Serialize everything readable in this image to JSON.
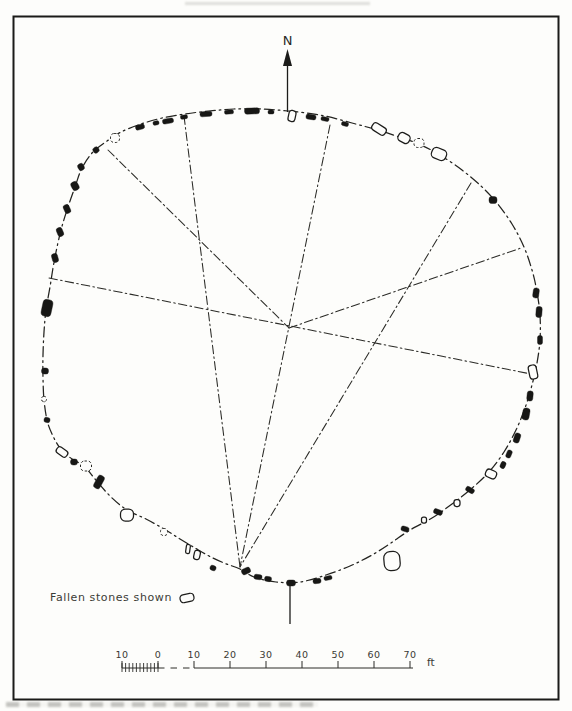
{
  "figure": {
    "background": "#fdfdfb",
    "ink": "#1c1c1a",
    "north": {
      "label": "N"
    },
    "legend": {
      "text": "Fallen stones shown"
    },
    "scalebar": {
      "labels": [
        "10",
        "0",
        "10",
        "20",
        "30",
        "40",
        "50",
        "60",
        "70"
      ],
      "unit": "ft",
      "x0": 122,
      "spacing": 36,
      "y": 668,
      "label_y": 658,
      "minor_step": 3.6,
      "end_x": 413,
      "unit_x": 427,
      "unit_y": 666
    },
    "ring_points": [
      [
        288,
        111
      ],
      [
        320,
        115
      ],
      [
        352,
        123
      ],
      [
        381,
        131
      ],
      [
        405,
        139
      ],
      [
        421,
        145
      ],
      [
        440,
        155
      ],
      [
        462,
        170
      ],
      [
        481,
        186
      ],
      [
        497,
        203
      ],
      [
        512,
        224
      ],
      [
        524,
        247
      ],
      [
        532,
        270
      ],
      [
        537,
        292
      ],
      [
        540,
        315
      ],
      [
        540,
        340
      ],
      [
        537,
        363
      ],
      [
        532,
        385
      ],
      [
        525,
        408
      ],
      [
        516,
        430
      ],
      [
        504,
        452
      ],
      [
        489,
        472
      ],
      [
        471,
        489
      ],
      [
        452,
        504
      ],
      [
        432,
        518
      ],
      [
        410,
        530
      ],
      [
        391,
        543
      ],
      [
        372,
        555
      ],
      [
        350,
        566
      ],
      [
        326,
        575
      ],
      [
        300,
        582
      ],
      [
        276,
        582
      ],
      [
        254,
        577
      ],
      [
        240,
        569
      ],
      [
        224,
        563
      ],
      [
        209,
        556
      ],
      [
        195,
        548
      ],
      [
        180,
        539
      ],
      [
        164,
        529
      ],
      [
        146,
        519
      ],
      [
        127,
        510
      ],
      [
        110,
        496
      ],
      [
        95,
        479
      ],
      [
        84,
        466
      ],
      [
        72,
        459
      ],
      [
        60,
        448
      ],
      [
        52,
        434
      ],
      [
        47,
        420
      ],
      [
        44,
        400
      ],
      [
        43,
        378
      ],
      [
        43,
        355
      ],
      [
        44,
        332
      ],
      [
        46,
        310
      ],
      [
        50,
        287
      ],
      [
        53,
        268
      ],
      [
        56,
        252
      ],
      [
        61,
        230
      ],
      [
        67,
        210
      ],
      [
        75,
        187
      ],
      [
        82,
        168
      ],
      [
        93,
        152
      ],
      [
        107,
        141
      ],
      [
        121,
        132
      ],
      [
        141,
        124
      ],
      [
        162,
        118
      ],
      [
        185,
        114
      ],
      [
        209,
        111
      ],
      [
        234,
        109
      ],
      [
        261,
        109
      ]
    ],
    "alignment_lines": [
      [
        49,
        278,
        531,
        374
      ],
      [
        108,
        150,
        289,
        328
      ],
      [
        184,
        116,
        240,
        567
      ],
      [
        330,
        125,
        240,
        567
      ],
      [
        471,
        183,
        240,
        567
      ],
      [
        289,
        328,
        521,
        248
      ]
    ],
    "north_arrow": {
      "shaft": [
        287.5,
        64,
        287.5,
        112
      ],
      "head": "287.5,49 283,66 292,66",
      "label_x": 287.5,
      "label_y": 45
    },
    "meridian": [
      290,
      584,
      290,
      624
    ],
    "legend_pos": {
      "text_x": 50,
      "text_y": 601,
      "sym_x": 187,
      "sym_y": 598,
      "sym_w": 14,
      "sym_h": 8,
      "sym_rot": -12
    },
    "frame": {
      "x": 13.5,
      "y": 16.5,
      "w": 545,
      "h": 683
    },
    "stones": [
      [
        168,
        121,
        11,
        5,
        -10,
        "f"
      ],
      [
        184,
        117,
        7,
        4,
        -8,
        "f"
      ],
      [
        206,
        114,
        12,
        5,
        -5,
        "f"
      ],
      [
        229,
        112,
        9,
        4,
        -3,
        "f"
      ],
      [
        252,
        111,
        15,
        6,
        -2,
        "f"
      ],
      [
        271,
        112,
        6,
        4,
        0,
        "f"
      ],
      [
        292,
        116,
        7,
        11,
        12,
        "o"
      ],
      [
        311,
        117,
        10,
        5,
        8,
        "f"
      ],
      [
        325,
        119,
        8,
        4,
        10,
        "f"
      ],
      [
        345,
        124,
        7,
        4,
        14,
        "f"
      ],
      [
        379,
        129,
        15,
        8,
        32,
        "o"
      ],
      [
        404,
        138,
        12,
        9,
        28,
        "o"
      ],
      [
        419,
        143,
        10,
        9,
        0,
        "d"
      ],
      [
        439,
        154,
        15,
        11,
        22,
        "o"
      ],
      [
        493,
        200,
        8,
        7,
        0,
        "f"
      ],
      [
        536,
        293,
        6,
        10,
        8,
        "f"
      ],
      [
        539,
        312,
        6,
        11,
        4,
        "f"
      ],
      [
        540,
        340,
        5,
        9,
        0,
        "f"
      ],
      [
        533,
        372,
        8,
        14,
        -12,
        "o"
      ],
      [
        530,
        396,
        6,
        10,
        6,
        "f"
      ],
      [
        526,
        414,
        7,
        12,
        10,
        "f"
      ],
      [
        517,
        438,
        6,
        10,
        18,
        "f"
      ],
      [
        509,
        454,
        5,
        8,
        22,
        "f"
      ],
      [
        503,
        465,
        5,
        7,
        24,
        "f"
      ],
      [
        491,
        474,
        11,
        8,
        24,
        "o"
      ],
      [
        470,
        490,
        9,
        5,
        28,
        "f"
      ],
      [
        457,
        503,
        6,
        7,
        0,
        "o"
      ],
      [
        438,
        512,
        9,
        5,
        20,
        "f"
      ],
      [
        424,
        520,
        5,
        6,
        0,
        "o"
      ],
      [
        405,
        529,
        8,
        5,
        16,
        "f"
      ],
      [
        392,
        561,
        16,
        19,
        -5,
        "o"
      ],
      [
        328,
        578,
        8,
        4,
        -10,
        "f"
      ],
      [
        317,
        581,
        8,
        5,
        -6,
        "f"
      ],
      [
        291,
        583,
        9,
        6,
        0,
        "f"
      ],
      [
        268,
        579,
        7,
        5,
        6,
        "f"
      ],
      [
        258,
        577,
        8,
        5,
        8,
        "f"
      ],
      [
        246,
        571,
        9,
        6,
        -25,
        "f"
      ],
      [
        213,
        568,
        6,
        5,
        20,
        "f"
      ],
      [
        197,
        555,
        6,
        9,
        12,
        "o"
      ],
      [
        188,
        549,
        4,
        9,
        8,
        "o"
      ],
      [
        164,
        532,
        7,
        7,
        0,
        "d"
      ],
      [
        127,
        515,
        13,
        12,
        0,
        "o"
      ],
      [
        99,
        482,
        7,
        14,
        28,
        "f"
      ],
      [
        86,
        466,
        11,
        10,
        0,
        "d"
      ],
      [
        74,
        462,
        7,
        6,
        0,
        "f"
      ],
      [
        62,
        452,
        12,
        7,
        35,
        "o"
      ],
      [
        47,
        420,
        6,
        5,
        10,
        "f"
      ],
      [
        44,
        399,
        5,
        5,
        0,
        "d"
      ],
      [
        45,
        371,
        7,
        6,
        5,
        "f"
      ],
      [
        47,
        308,
        10,
        17,
        12,
        "f"
      ],
      [
        55,
        258,
        6,
        9,
        -15,
        "f"
      ],
      [
        60,
        232,
        6,
        9,
        -22,
        "f"
      ],
      [
        67,
        209,
        6,
        9,
        -25,
        "f"
      ],
      [
        75,
        186,
        7,
        9,
        -28,
        "f"
      ],
      [
        81,
        167,
        6,
        7,
        -30,
        "f"
      ],
      [
        96,
        150,
        6,
        6,
        -35,
        "f"
      ],
      [
        115,
        138,
        9,
        9,
        0,
        "d"
      ],
      [
        140,
        127,
        9,
        5,
        -15,
        "f"
      ],
      [
        156,
        123,
        6,
        4,
        -12,
        "f"
      ]
    ]
  }
}
